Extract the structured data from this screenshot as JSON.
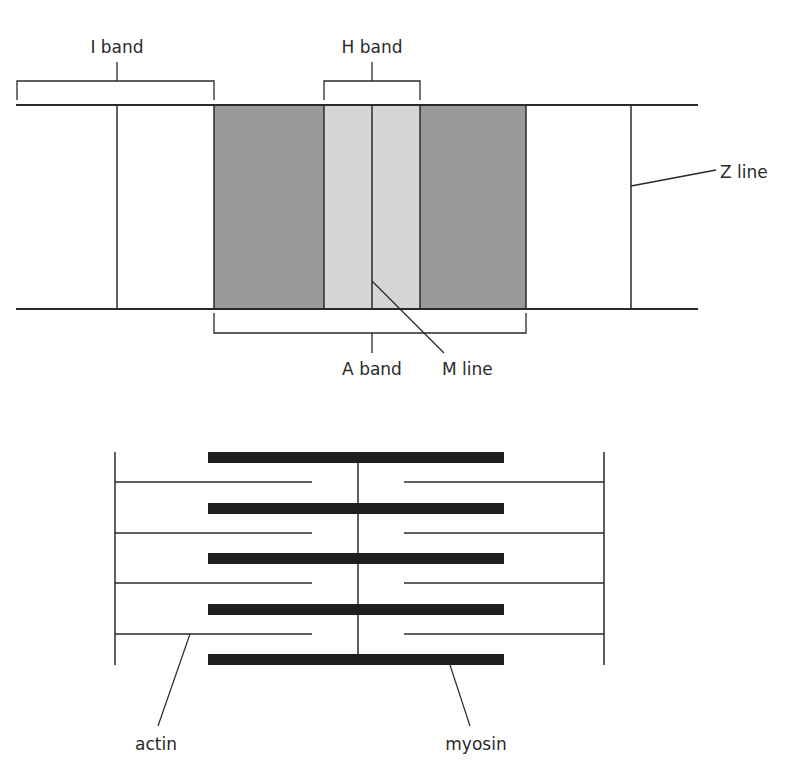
{
  "diagram": {
    "colors": {
      "line": "#2a2a2a",
      "a_band_fill": "#9a9a9a",
      "h_band_fill": "#d6d6d6",
      "myosin": "#1e1e1e",
      "background": "#ffffff"
    },
    "top_labels": {
      "i_band": "I band",
      "h_band": "H band",
      "z_line": "Z line",
      "a_band": "A band",
      "m_line": "M line"
    },
    "bottom_labels": {
      "actin": "actin",
      "myosin": "myosin"
    },
    "filaments": {
      "myosin_count": 5,
      "actin_count_per_side": 4
    }
  }
}
